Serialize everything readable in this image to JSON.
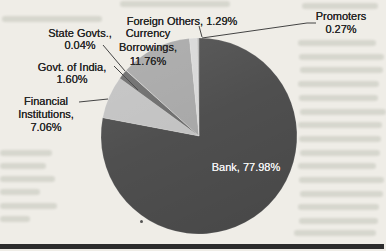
{
  "figure": {
    "kind": "scanned textbook pie chart figure",
    "paper_color": "#efede7",
    "rule_color": "#2c2c2c",
    "callout_label_color": "#262626",
    "inside_label_color": "#f2f2f2",
    "leader_line_color": "#444444"
  },
  "chart_data": {
    "type": "pie",
    "title": "",
    "unit": "percent",
    "total": 100.0,
    "start_angle_deg": 0,
    "direction": "clockwise",
    "legend": "none",
    "label_style": "category name + percentage callouts, largest slice labeled inside",
    "slices": [
      {
        "id": "bank",
        "label": "Bank",
        "value": 77.98,
        "display": "Bank, 77.98%",
        "color": "#4f4f4f",
        "lines": [
          "Bank, 77.98%"
        ],
        "label_position": "inside"
      },
      {
        "id": "financial-institutions",
        "label": "Financial Institutions",
        "value": 7.06,
        "display": "Financial Institutions, 7.06%",
        "color": "#c3c3c3",
        "lines": [
          "Financial",
          "Institutions,",
          "7.06%"
        ],
        "label_position": "outside-left"
      },
      {
        "id": "govt-of-india",
        "label": "Govt. of India",
        "value": 1.6,
        "display": "Govt. of India, 1.60%",
        "color": "#6e6e6e",
        "lines": [
          "Govt. of India,",
          "1.60%"
        ],
        "label_position": "outside-left"
      },
      {
        "id": "state-govts",
        "label": "State Govts.",
        "value": 0.04,
        "display": "State Govts., 0.04%",
        "color": "#d9d9d9",
        "lines": [
          "State Govts.,",
          "0.04%"
        ],
        "label_position": "outside-upper-left"
      },
      {
        "id": "currency-borrowings",
        "label": "Currency Borrowings",
        "value": 11.76,
        "display": "Currency Borrowings, 11.76%",
        "color": "#a9a9a9",
        "lines": [
          "Currency",
          "Borrowings,",
          "11.76%"
        ],
        "label_position": "outside-top"
      },
      {
        "id": "foreign-others",
        "label": "Foreign Others",
        "value": 1.29,
        "display": "Foreign Others, 1.29%",
        "color": "#d8d8d8",
        "lines": [
          "Foreign Others, 1.29%"
        ],
        "label_position": "outside-top"
      },
      {
        "id": "promoters",
        "label": "Promoters",
        "value": 0.27,
        "display": "Promoters 0.27%",
        "color": "#b0b0b0",
        "lines": [
          "Promoters",
          "0.27%"
        ],
        "label_position": "outside-top-right"
      }
    ]
  }
}
